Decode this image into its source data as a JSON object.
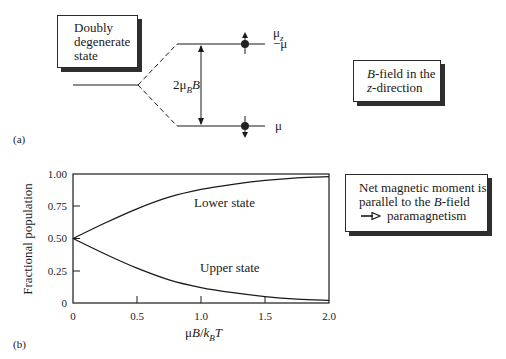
{
  "panel_a": {
    "label": "(a)",
    "degenerate_box": {
      "lines": [
        "Doubly",
        "degenerate",
        "state"
      ]
    },
    "splitting_label": {
      "prefix": "2μ",
      "sub": "B",
      "suffix": "B"
    },
    "axis_label": {
      "main": "μ",
      "sub": "z"
    },
    "upper_level_value": "−μ",
    "lower_level_value": "μ",
    "field_box": {
      "line1_italic": "B",
      "line1_rest": "-field in the",
      "line2_italic": "z",
      "line2_rest": "-direction"
    }
  },
  "panel_b": {
    "label": "(b)",
    "annotation_box": {
      "line1": "Net magnetic moment is",
      "line2_pre": "parallel to the ",
      "line2_italic": "B",
      "line2_post": "-field",
      "line3_arrow": "⟶",
      "line3": "paramagnetism"
    }
  },
  "chart_data": {
    "type": "line",
    "title": "",
    "xlabel": "μB/k_BT",
    "ylabel": "Fractional population",
    "xlim": [
      0,
      2.0
    ],
    "ylim": [
      0,
      1.0
    ],
    "xticks": [
      "0",
      "0.5",
      "1.0",
      "1.5",
      "2.0"
    ],
    "yticks": [
      "0",
      "0.25",
      "0.50",
      "0.75",
      "1.00"
    ],
    "grid": false,
    "x": [
      0,
      0.25,
      0.5,
      0.75,
      1.0,
      1.25,
      1.5,
      1.75,
      2.0
    ],
    "series": [
      {
        "name": "Lower state",
        "values": [
          0.5,
          0.62,
          0.73,
          0.82,
          0.88,
          0.92,
          0.95,
          0.97,
          0.98
        ]
      },
      {
        "name": "Upper state",
        "values": [
          0.5,
          0.38,
          0.27,
          0.18,
          0.12,
          0.08,
          0.05,
          0.03,
          0.02
        ]
      }
    ],
    "annotations": [
      "Lower state",
      "Upper state"
    ]
  }
}
